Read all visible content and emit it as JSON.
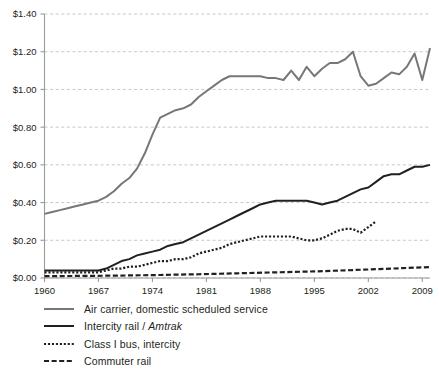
{
  "chart_data": {
    "type": "line",
    "title": "",
    "xlabel": "",
    "ylabel": "",
    "xlim": [
      1960,
      2010
    ],
    "ylim": [
      0.0,
      1.4
    ],
    "grid": true,
    "legend_position": "bottom-left",
    "y_tick_labels": [
      "$0.00",
      "$0.20",
      "$0.40",
      "$0.60",
      "$0.80",
      "$1.00",
      "$1.20",
      "$1.40"
    ],
    "y_tick_values": [
      0.0,
      0.2,
      0.4,
      0.6,
      0.8,
      1.0,
      1.2,
      1.4
    ],
    "x_tick_labels": [
      "1960",
      "1967",
      "1974",
      "1981",
      "1988",
      "1995",
      "2002",
      "2009"
    ],
    "x_tick_values": [
      1960,
      1967,
      1974,
      1981,
      1988,
      1995,
      2002,
      2009
    ],
    "series": [
      {
        "name": "Air carrier, domestic scheduled service",
        "style": "solid",
        "color": "#777777",
        "width": 2.0,
        "x": [
          1960,
          1961,
          1962,
          1963,
          1964,
          1965,
          1966,
          1967,
          1968,
          1969,
          1970,
          1971,
          1972,
          1973,
          1974,
          1975,
          1976,
          1977,
          1978,
          1979,
          1980,
          1981,
          1982,
          1983,
          1984,
          1985,
          1986,
          1987,
          1988,
          1989,
          1990,
          1991,
          1992,
          1993,
          1994,
          1995,
          1996,
          1997,
          1998,
          1999,
          2000,
          2001,
          2002,
          2003,
          2004,
          2005,
          2006,
          2007,
          2008,
          2009,
          2010
        ],
        "values": [
          0.34,
          0.35,
          0.36,
          0.37,
          0.38,
          0.39,
          0.4,
          0.41,
          0.43,
          0.46,
          0.5,
          0.53,
          0.58,
          0.66,
          0.76,
          0.85,
          0.87,
          0.89,
          0.9,
          0.92,
          0.96,
          0.99,
          1.02,
          1.05,
          1.07,
          1.07,
          1.07,
          1.07,
          1.07,
          1.06,
          1.06,
          1.05,
          1.1,
          1.05,
          1.12,
          1.07,
          1.11,
          1.14,
          1.14,
          1.16,
          1.2,
          1.07,
          1.02,
          1.03,
          1.06,
          1.09,
          1.08,
          1.12,
          1.19,
          1.05,
          1.22
        ]
      },
      {
        "name": "Intercity rail / Amtrak",
        "style": "solid",
        "color": "#231f20",
        "width": 2.0,
        "x": [
          1960,
          1961,
          1962,
          1963,
          1964,
          1965,
          1966,
          1967,
          1968,
          1969,
          1970,
          1971,
          1972,
          1973,
          1974,
          1975,
          1976,
          1977,
          1978,
          1979,
          1980,
          1981,
          1982,
          1983,
          1984,
          1985,
          1986,
          1987,
          1988,
          1989,
          1990,
          1991,
          1992,
          1993,
          1994,
          1995,
          1996,
          1997,
          1998,
          1999,
          2000,
          2001,
          2002,
          2003,
          2004,
          2005,
          2006,
          2007,
          2008,
          2009,
          2010
        ],
        "values": [
          0.04,
          0.04,
          0.04,
          0.04,
          0.04,
          0.04,
          0.04,
          0.04,
          0.05,
          0.07,
          0.09,
          0.1,
          0.12,
          0.13,
          0.14,
          0.15,
          0.17,
          0.18,
          0.19,
          0.21,
          0.23,
          0.25,
          0.27,
          0.29,
          0.31,
          0.33,
          0.35,
          0.37,
          0.39,
          0.4,
          0.41,
          0.41,
          0.41,
          0.41,
          0.41,
          0.4,
          0.39,
          0.4,
          0.41,
          0.43,
          0.45,
          0.47,
          0.48,
          0.51,
          0.54,
          0.55,
          0.55,
          0.57,
          0.59,
          0.59,
          0.6
        ]
      },
      {
        "name": "Class I bus, intercity",
        "style": "dotted",
        "color": "#231f20",
        "width": 2.2,
        "x": [
          1960,
          1961,
          1962,
          1963,
          1964,
          1965,
          1966,
          1967,
          1968,
          1969,
          1970,
          1971,
          1972,
          1973,
          1974,
          1975,
          1976,
          1977,
          1978,
          1979,
          1980,
          1981,
          1982,
          1983,
          1984,
          1985,
          1986,
          1987,
          1988,
          1989,
          1990,
          1991,
          1992,
          1993,
          1994,
          1995,
          1996,
          1997,
          1998,
          1999,
          2000,
          2001,
          2002,
          2003
        ],
        "values": [
          0.03,
          0.03,
          0.03,
          0.03,
          0.03,
          0.03,
          0.03,
          0.03,
          0.04,
          0.05,
          0.05,
          0.06,
          0.06,
          0.07,
          0.08,
          0.09,
          0.09,
          0.1,
          0.1,
          0.11,
          0.13,
          0.14,
          0.15,
          0.16,
          0.18,
          0.19,
          0.2,
          0.21,
          0.22,
          0.22,
          0.22,
          0.22,
          0.22,
          0.21,
          0.2,
          0.2,
          0.21,
          0.23,
          0.25,
          0.26,
          0.26,
          0.24,
          0.27,
          0.3
        ]
      },
      {
        "name": "Commuter rail",
        "style": "dashed",
        "color": "#231f20",
        "width": 2.2,
        "x": [
          1960,
          1965,
          1970,
          1975,
          1980,
          1985,
          1990,
          1995,
          2000,
          2005,
          2010
        ],
        "values": [
          0.01,
          0.011,
          0.013,
          0.016,
          0.02,
          0.025,
          0.03,
          0.035,
          0.042,
          0.05,
          0.058
        ]
      }
    ]
  },
  "legend": {
    "items": [
      {
        "label": "Air carrier, domestic scheduled service",
        "label_italic": "",
        "style": "solid",
        "color": "#777777"
      },
      {
        "label": "Intercity rail / ",
        "label_italic": "Amtrak",
        "style": "solid",
        "color": "#231f20"
      },
      {
        "label": "Class I bus, intercity",
        "label_italic": "",
        "style": "dotted",
        "color": "#231f20"
      },
      {
        "label": "Commuter rail",
        "label_italic": "",
        "style": "dashed",
        "color": "#231f20"
      }
    ]
  }
}
